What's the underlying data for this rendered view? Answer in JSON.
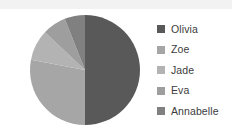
{
  "chart_data": {
    "type": "pie",
    "title": "",
    "categories": [
      "Olivia",
      "Zoe",
      "Jade",
      "Eva",
      "Annabelle"
    ],
    "values": [
      50,
      28,
      9,
      7,
      6
    ],
    "colors": [
      "#595959",
      "#a6a6a6",
      "#b3b3b3",
      "#9e9e9e",
      "#808080"
    ],
    "legend_position": "right",
    "grid": false,
    "xlabel": "",
    "ylabel": "",
    "start_angle_deg": 0,
    "direction": "clockwise"
  },
  "legend": {
    "items": [
      {
        "label": "Olivia",
        "color": "#595959"
      },
      {
        "label": "Zoe",
        "color": "#a6a6a6"
      },
      {
        "label": "Jade",
        "color": "#b3b3b3"
      },
      {
        "label": "Eva",
        "color": "#9e9e9e"
      },
      {
        "label": "Annabelle",
        "color": "#808080"
      }
    ]
  },
  "canvas": {
    "background": "#ffffff",
    "band_color": "#f2f2f2"
  },
  "pie_geometry": {
    "cx": 85,
    "cy": 70,
    "r": 55
  }
}
